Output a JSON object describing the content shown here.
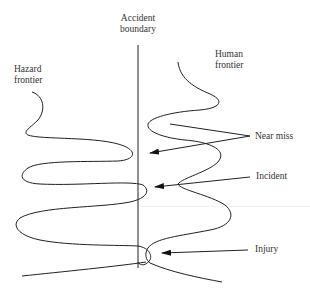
{
  "diagram": {
    "labels": {
      "accident_boundary": [
        "Accident",
        "boundary"
      ],
      "hazard_frontier": [
        "Hazard",
        "frontier"
      ],
      "human_frontier": [
        "Human",
        "frontier"
      ],
      "near_miss": "Near miss",
      "incident": "Incident",
      "injury": "Injury"
    },
    "colors": {
      "line": "#222222",
      "text": "#333333",
      "background": "#ffffff"
    }
  }
}
